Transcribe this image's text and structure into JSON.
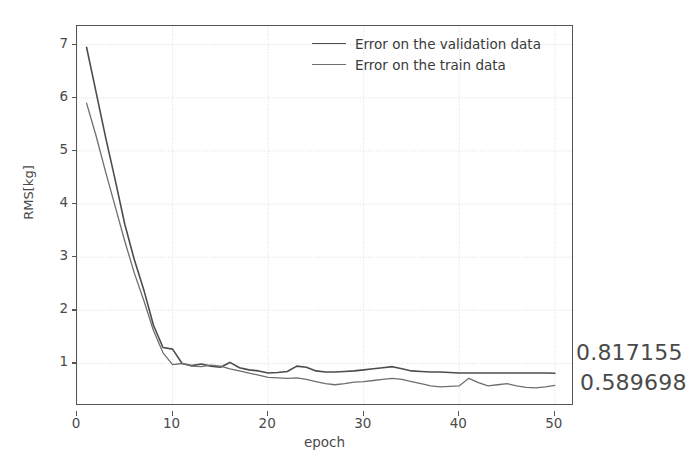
{
  "chart_data": {
    "type": "line",
    "title": "",
    "xlabel": "epoch",
    "ylabel": "RMS[kg]",
    "xlim": [
      0,
      52
    ],
    "ylim": [
      0.2,
      7.35
    ],
    "xticks": [
      0,
      10,
      20,
      30,
      40,
      50
    ],
    "yticks": [
      1,
      2,
      3,
      4,
      5,
      6,
      7
    ],
    "grid": true,
    "legend_position": "upper right",
    "x": [
      1,
      2,
      3,
      4,
      5,
      6,
      7,
      8,
      9,
      10,
      11,
      12,
      13,
      14,
      15,
      16,
      17,
      18,
      19,
      20,
      21,
      22,
      23,
      24,
      25,
      26,
      27,
      28,
      29,
      30,
      31,
      32,
      33,
      34,
      35,
      36,
      37,
      38,
      39,
      40,
      41,
      42,
      43,
      44,
      45,
      46,
      47,
      48,
      49,
      50
    ],
    "series": [
      {
        "name": "Error on the validation data",
        "color": "#4d4d4d",
        "values": [
          6.95,
          6.1,
          5.25,
          4.45,
          3.62,
          2.95,
          2.38,
          1.72,
          1.3,
          1.27,
          1.0,
          0.96,
          0.99,
          0.95,
          0.93,
          1.02,
          0.92,
          0.88,
          0.86,
          0.82,
          0.83,
          0.85,
          0.95,
          0.93,
          0.86,
          0.84,
          0.84,
          0.85,
          0.86,
          0.88,
          0.9,
          0.92,
          0.94,
          0.9,
          0.86,
          0.85,
          0.84,
          0.84,
          0.83,
          0.82,
          0.82,
          0.82,
          0.82,
          0.82,
          0.82,
          0.82,
          0.82,
          0.82,
          0.82,
          0.817155
        ]
      },
      {
        "name": "Error on the train data",
        "color": "#6e6e6e",
        "values": [
          5.9,
          5.28,
          4.6,
          3.95,
          3.3,
          2.7,
          2.18,
          1.62,
          1.2,
          0.98,
          1.0,
          0.95,
          0.94,
          0.97,
          0.95,
          0.9,
          0.86,
          0.82,
          0.78,
          0.74,
          0.73,
          0.72,
          0.73,
          0.7,
          0.66,
          0.62,
          0.6,
          0.62,
          0.65,
          0.66,
          0.68,
          0.7,
          0.72,
          0.7,
          0.66,
          0.62,
          0.58,
          0.56,
          0.57,
          0.58,
          0.72,
          0.64,
          0.58,
          0.6,
          0.62,
          0.58,
          0.55,
          0.54,
          0.56,
          0.589698
        ]
      }
    ],
    "annotations": [
      {
        "name": "validation-end-value",
        "text": "0.817155"
      },
      {
        "name": "train-end-value",
        "text": "0.589698"
      }
    ]
  },
  "legend": {
    "items": [
      {
        "label": "Error on the validation data"
      },
      {
        "label": "Error on the train data"
      }
    ]
  }
}
